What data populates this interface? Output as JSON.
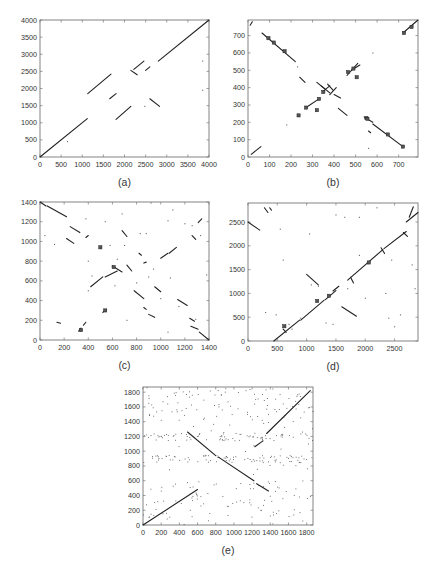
{
  "chart_data": [
    {
      "id": "a",
      "type": "scatter",
      "caption": "(a)",
      "title": "",
      "xlabel": "",
      "ylabel": "",
      "xlim": [
        0,
        4000
      ],
      "ylim": [
        0,
        4000
      ],
      "xticks": [
        0,
        500,
        1000,
        1500,
        2000,
        2500,
        3000,
        3500,
        4000
      ],
      "yticks": [
        0,
        500,
        1000,
        1500,
        2000,
        2500,
        3000,
        3500,
        4000
      ],
      "grid": false,
      "frame_px": {
        "left": 40,
        "top": 20,
        "right": 209,
        "bottom": 157
      },
      "segments": [
        [
          0,
          0,
          1120,
          1120
        ],
        [
          1130,
          1850,
          1680,
          2420
        ],
        [
          1650,
          1700,
          1800,
          1850
        ],
        [
          1800,
          1100,
          2150,
          1480
        ],
        [
          2220,
          2560,
          2460,
          2800
        ],
        [
          2150,
          2530,
          2300,
          2400
        ],
        [
          2500,
          2530,
          2600,
          2630
        ],
        [
          2600,
          1700,
          2830,
          1480
        ],
        [
          2800,
          2800,
          4000,
          4000
        ]
      ],
      "points": [
        [
          650,
          450
        ],
        [
          2480,
          1480
        ],
        [
          3850,
          2800
        ],
        [
          3850,
          1950
        ]
      ]
    },
    {
      "id": "b",
      "type": "scatter",
      "caption": "(b)",
      "title": "",
      "xlabel": "",
      "ylabel": "",
      "xlim": [
        0,
        790
      ],
      "ylim": [
        0,
        790
      ],
      "xticks": [
        0,
        100,
        200,
        300,
        400,
        500,
        600,
        700
      ],
      "yticks": [
        0,
        100,
        200,
        300,
        400,
        500,
        600,
        700
      ],
      "grid": false,
      "frame_px": {
        "left": 248,
        "top": 20,
        "right": 418,
        "bottom": 157
      },
      "segments": [
        [
          65,
          715,
          220,
          550
        ],
        [
          240,
          460,
          265,
          430
        ],
        [
          270,
          285,
          330,
          335
        ],
        [
          320,
          430,
          360,
          390
        ],
        [
          340,
          410,
          380,
          370
        ],
        [
          370,
          420,
          395,
          385
        ],
        [
          350,
          380,
          380,
          410
        ],
        [
          380,
          360,
          410,
          400
        ],
        [
          400,
          360,
          430,
          340
        ],
        [
          420,
          280,
          460,
          240
        ],
        [
          460,
          470,
          510,
          540
        ],
        [
          480,
          500,
          520,
          530
        ],
        [
          540,
          230,
          580,
          200
        ],
        [
          580,
          190,
          720,
          60
        ],
        [
          560,
          150,
          570,
          140
        ],
        [
          720,
          715,
          790,
          790
        ],
        [
          15,
          15,
          60,
          60
        ],
        [
          10,
          760,
          20,
          780
        ]
      ],
      "markers": [
        [
          95,
          685
        ],
        [
          120,
          660
        ],
        [
          170,
          610
        ],
        [
          235,
          240
        ],
        [
          270,
          285
        ],
        [
          330,
          335
        ],
        [
          320,
          270
        ],
        [
          350,
          375
        ],
        [
          465,
          490
        ],
        [
          490,
          510
        ],
        [
          505,
          460
        ],
        [
          550,
          225
        ],
        [
          555,
          220
        ],
        [
          650,
          130
        ],
        [
          720,
          60
        ],
        [
          725,
          715
        ],
        [
          760,
          750
        ]
      ],
      "points": [
        [
          180,
          185
        ],
        [
          560,
          50
        ],
        [
          580,
          600
        ],
        [
          230,
          520
        ]
      ]
    },
    {
      "id": "c",
      "type": "scatter",
      "caption": "(c)",
      "title": "",
      "xlabel": "",
      "ylabel": "",
      "xlim": [
        0,
        1400
      ],
      "ylim": [
        0,
        1400
      ],
      "xticks": [
        0,
        200,
        400,
        600,
        800,
        1000,
        1200,
        1400
      ],
      "yticks": [
        0,
        200,
        400,
        600,
        800,
        1000,
        1200,
        1400
      ],
      "grid": false,
      "frame_px": {
        "left": 40,
        "top": 202,
        "right": 209,
        "bottom": 340
      },
      "segments": [
        [
          0,
          1400,
          50,
          1360
        ],
        [
          60,
          1360,
          220,
          1250
        ],
        [
          250,
          1150,
          330,
          1090
        ],
        [
          220,
          1030,
          280,
          980
        ],
        [
          400,
          1060,
          380,
          1040
        ],
        [
          420,
          540,
          520,
          640
        ],
        [
          540,
          640,
          640,
          700
        ],
        [
          600,
          750,
          680,
          690
        ],
        [
          680,
          1110,
          720,
          1050
        ],
        [
          720,
          760,
          760,
          700
        ],
        [
          780,
          500,
          860,
          420
        ],
        [
          860,
          330,
          880,
          310
        ],
        [
          900,
          260,
          950,
          230
        ],
        [
          950,
          540,
          1000,
          490
        ],
        [
          1000,
          830,
          1060,
          880
        ],
        [
          1070,
          880,
          1130,
          940
        ],
        [
          1140,
          410,
          1220,
          350
        ],
        [
          1240,
          220,
          1280,
          190
        ],
        [
          1250,
          140,
          1310,
          110
        ],
        [
          1320,
          80,
          1400,
          0
        ],
        [
          1310,
          1190,
          1340,
          1230
        ],
        [
          1260,
          1060,
          1290,
          1020
        ],
        [
          140,
          180,
          170,
          170
        ],
        [
          320,
          90,
          340,
          120
        ],
        [
          360,
          150,
          380,
          180
        ],
        [
          520,
          280,
          550,
          310
        ],
        [
          820,
          880,
          840,
          860
        ],
        [
          860,
          780,
          880,
          790
        ]
      ],
      "markers": [
        [
          500,
          940
        ],
        [
          610,
          740
        ],
        [
          540,
          300
        ],
        [
          340,
          100
        ]
      ],
      "points": [
        [
          40,
          1060
        ],
        [
          120,
          970
        ],
        [
          380,
          1230
        ],
        [
          400,
          800
        ],
        [
          430,
          650
        ],
        [
          400,
          500
        ],
        [
          540,
          1200
        ],
        [
          580,
          960
        ],
        [
          620,
          550
        ],
        [
          640,
          820
        ],
        [
          700,
          960
        ],
        [
          720,
          200
        ],
        [
          800,
          580
        ],
        [
          830,
          1080
        ],
        [
          880,
          1080
        ],
        [
          900,
          640
        ],
        [
          940,
          720
        ],
        [
          1000,
          420
        ],
        [
          1060,
          1210
        ],
        [
          1080,
          630
        ],
        [
          1100,
          1320
        ],
        [
          1150,
          340
        ],
        [
          1200,
          1180
        ],
        [
          1260,
          1160
        ],
        [
          1290,
          210
        ],
        [
          1330,
          1060
        ],
        [
          1380,
          660
        ],
        [
          1060,
          80
        ],
        [
          920,
          1390
        ],
        [
          680,
          1280
        ]
      ]
    },
    {
      "id": "d",
      "type": "scatter",
      "caption": "(d)",
      "title": "",
      "xlabel": "",
      "ylabel": "",
      "xlim": [
        0,
        2900
      ],
      "ylim": [
        0,
        2900
      ],
      "xticks": [
        0,
        500,
        1000,
        1500,
        2000,
        2500
      ],
      "yticks": [
        0,
        500,
        1000,
        1500,
        2000,
        2500
      ],
      "grid": false,
      "frame_px": {
        "left": 248,
        "top": 203,
        "right": 418,
        "bottom": 341
      },
      "segments": [
        [
          440,
          0,
          880,
          440
        ],
        [
          900,
          440,
          1300,
          860
        ],
        [
          1320,
          870,
          1500,
          1060
        ],
        [
          1700,
          1280,
          2300,
          1920
        ],
        [
          2320,
          1940,
          2700,
          2300
        ],
        [
          2700,
          2500,
          2900,
          2700
        ],
        [
          0,
          2500,
          200,
          2330
        ],
        [
          1000,
          1400,
          1200,
          1180
        ],
        [
          1600,
          720,
          1850,
          520
        ],
        [
          280,
          2800,
          340,
          2700
        ],
        [
          370,
          2800,
          400,
          2750
        ],
        [
          2750,
          2600,
          2820,
          2820
        ],
        [
          600,
          250,
          650,
          180
        ],
        [
          1750,
          1340,
          1800,
          1220
        ],
        [
          2270,
          1960,
          2330,
          1840
        ],
        [
          2650,
          2280,
          2720,
          2200
        ],
        [
          1450,
          1050,
          1550,
          1150
        ]
      ],
      "markers": [
        [
          620,
          310
        ],
        [
          1380,
          950
        ],
        [
          1180,
          840
        ],
        [
          2060,
          1650
        ]
      ],
      "points": [
        [
          300,
          600
        ],
        [
          480,
          550
        ],
        [
          700,
          350
        ],
        [
          750,
          250
        ],
        [
          900,
          480
        ],
        [
          1050,
          2250
        ],
        [
          1080,
          1180
        ],
        [
          1200,
          1150
        ],
        [
          1330,
          380
        ],
        [
          1500,
          2650
        ],
        [
          1650,
          2600
        ],
        [
          1900,
          2600
        ],
        [
          2000,
          900
        ],
        [
          2200,
          2800
        ],
        [
          2350,
          1000
        ],
        [
          2400,
          480
        ],
        [
          2450,
          1700
        ],
        [
          2500,
          300
        ],
        [
          2600,
          550
        ],
        [
          2800,
          1600
        ],
        [
          2850,
          1100
        ],
        [
          550,
          2350
        ],
        [
          600,
          1700
        ],
        [
          1700,
          1100
        ],
        [
          1450,
          350
        ],
        [
          1900,
          1800
        ]
      ]
    },
    {
      "id": "e",
      "type": "scatter",
      "caption": "(e)",
      "title": "",
      "xlabel": "",
      "ylabel": "",
      "xlim": [
        0,
        1870
      ],
      "ylim": [
        0,
        1870
      ],
      "xticks": [
        0,
        200,
        400,
        600,
        800,
        1000,
        1200,
        1400,
        1600,
        1800
      ],
      "yticks": [
        0,
        200,
        400,
        600,
        800,
        1000,
        1200,
        1400,
        1600,
        1800
      ],
      "grid": false,
      "frame_px": {
        "left": 143,
        "top": 387,
        "right": 313,
        "bottom": 525
      },
      "segments": [
        [
          0,
          0,
          600,
          480
        ],
        [
          490,
          1260,
          800,
          940
        ],
        [
          830,
          920,
          1220,
          600
        ],
        [
          1250,
          560,
          1380,
          460
        ],
        [
          1230,
          1060,
          1320,
          1140
        ],
        [
          1360,
          1240,
          1840,
          1820
        ]
      ],
      "markers": [],
      "noise_density": 380,
      "noise_bands_y": [
        [
          100,
          600
        ],
        [
          850,
          950
        ],
        [
          1150,
          1250
        ],
        [
          1400,
          1870
        ]
      ]
    }
  ]
}
